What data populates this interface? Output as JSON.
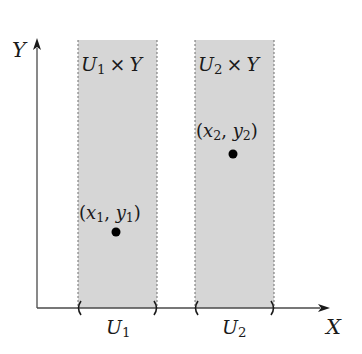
{
  "diagram": {
    "axes": {
      "x_label": "X",
      "y_label": "Y"
    },
    "strips": [
      {
        "label_base": "U",
        "label_sub": "1",
        "label_times": "×",
        "label_factor": "Y",
        "interval_base": "U",
        "interval_sub": "1"
      },
      {
        "label_base": "U",
        "label_sub": "2",
        "label_times": "×",
        "label_factor": "Y",
        "interval_base": "U",
        "interval_sub": "2"
      }
    ],
    "points": [
      {
        "open": "(",
        "x_base": "x",
        "x_sub": "1",
        "comma": ",",
        "y_base": "y",
        "y_sub": "1",
        "close": ")"
      },
      {
        "open": "(",
        "x_base": "x",
        "x_sub": "2",
        "comma": ",",
        "y_base": "y",
        "y_sub": "2",
        "close": ")"
      }
    ],
    "colors": {
      "strip_fill": "#d6d6d6",
      "strip_border": "#6e6e6e",
      "axis": "#4a4a4a",
      "point": "#000000"
    }
  }
}
